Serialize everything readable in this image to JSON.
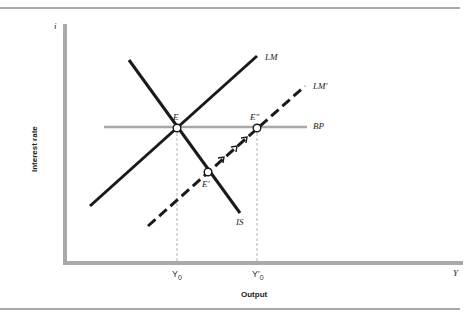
{
  "diagram": {
    "type": "IS-LM-BP",
    "axes": {
      "y_symbol": "i",
      "x_symbol": "Y",
      "y_title": "Interest rate",
      "x_title": "Output"
    },
    "curves": {
      "lm": "LM",
      "lm_prime": "LM′",
      "is": "IS",
      "bp": "BP"
    },
    "points": {
      "e": "E",
      "e_prime": "E′",
      "e_double_prime": "E″"
    },
    "ticks": {
      "y0": "Y",
      "y0_sub": "0",
      "y0_prime": "Y′",
      "y0_prime_sub": "0"
    },
    "colors": {
      "curve": "#1a1a1a",
      "axis": "#a9a9a9",
      "bp": "#a9a9a9",
      "guide": "#b5b5b5",
      "rule": "#555555"
    }
  }
}
